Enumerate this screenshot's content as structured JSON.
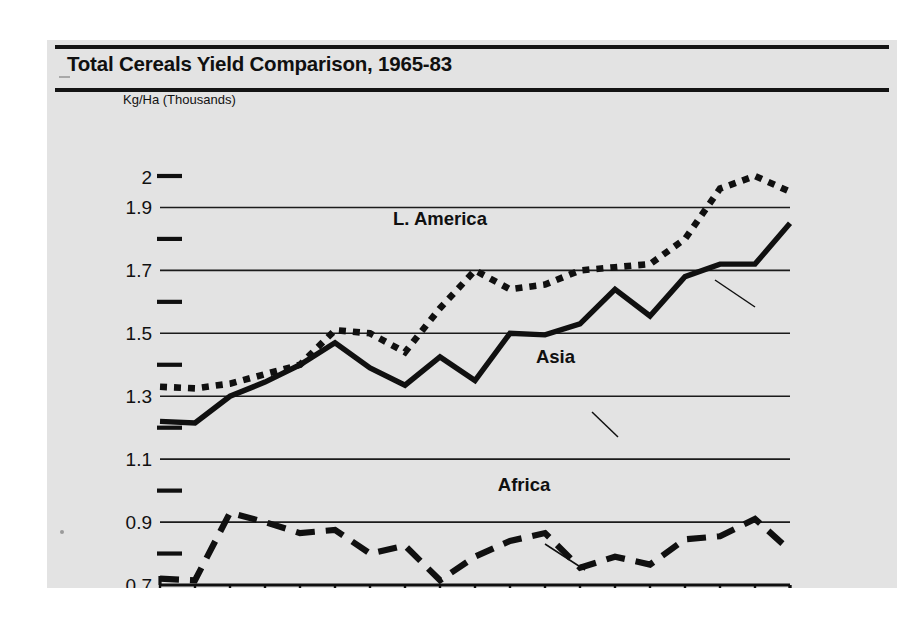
{
  "figure": {
    "title": "Total Cereals Yield Comparison, 1965-83",
    "background_color": "#e3e3e3",
    "ink_color": "#101010"
  },
  "chart_data": {
    "type": "line",
    "title": "Total Cereals Yield Comparison, 1965-83",
    "subtitle": "",
    "xlabel": "",
    "ylabel": "Kg/Ha (Thousands)",
    "grid": true,
    "legend_position": "inline-annotations",
    "xlim": [
      1965,
      1983
    ],
    "ylim": [
      0.7,
      2.0
    ],
    "x": [
      1965,
      1966,
      1967,
      1968,
      1969,
      1970,
      1971,
      1972,
      1973,
      1974,
      1975,
      1976,
      1977,
      1978,
      1979,
      1980,
      1981,
      1982,
      1983
    ],
    "x_tick_labels": [
      "1965",
      "",
      "67",
      "",
      "69",
      "",
      "71",
      "",
      "73",
      "",
      "75",
      "",
      "77",
      "",
      "79",
      "",
      "81",
      "",
      "83"
    ],
    "y_major_ticks": [
      1.9,
      1.7,
      1.5,
      1.3,
      1.1,
      0.9
    ],
    "y_major_tick_labels": [
      "1.9",
      "1.7",
      "1.5",
      "1.3",
      "1.1",
      "0.9"
    ],
    "y_minor_ticks": [
      2.0,
      1.8,
      1.6,
      1.4,
      1.2,
      1.0,
      0.8
    ],
    "y_minor_tick_labels": [
      "2",
      "",
      "",
      "",
      "",
      "",
      ""
    ],
    "y_axis_origin_label": "0.7",
    "series": [
      {
        "name": "L. America",
        "style": "dotted",
        "label_x": 1973.0,
        "label_y": 1.845,
        "values": [
          1.33,
          1.325,
          1.34,
          1.37,
          1.4,
          1.51,
          1.5,
          1.44,
          1.58,
          1.7,
          1.64,
          1.655,
          1.7,
          1.71,
          1.72,
          1.8,
          1.96,
          2.0,
          1.95
        ]
      },
      {
        "name": "Asia",
        "style": "solid",
        "label_x": 1976.3,
        "label_y": 1.405,
        "values": [
          1.22,
          1.215,
          1.3,
          1.345,
          1.4,
          1.47,
          1.39,
          1.335,
          1.425,
          1.35,
          1.5,
          1.495,
          1.53,
          1.64,
          1.555,
          1.68,
          1.72,
          1.72,
          1.85
        ]
      },
      {
        "name": "Africa",
        "style": "dashed",
        "label_x": 1975.4,
        "label_y": 1.0,
        "values": [
          0.72,
          0.715,
          0.93,
          0.9,
          0.865,
          0.875,
          0.8,
          0.825,
          0.715,
          0.79,
          0.84,
          0.865,
          0.755,
          0.79,
          0.765,
          0.845,
          0.855,
          0.91,
          0.81
        ]
      }
    ]
  }
}
